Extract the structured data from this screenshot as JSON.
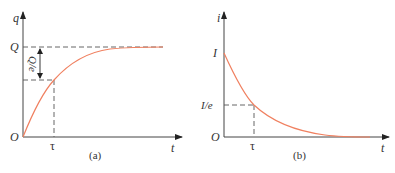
{
  "figure_a": {
    "caption": "(a)",
    "y_axis_label": "q",
    "x_axis_label": "t",
    "origin_label": "O",
    "level_label": "Q",
    "gap_label": "Q/e",
    "time_constant_label": "τ",
    "curve": "q = Q(1 - e^(-t/τ))",
    "curve_color": "#f08060"
  },
  "figure_b": {
    "caption": "(b)",
    "y_axis_label": "i",
    "x_axis_label": "t",
    "origin_label": "O",
    "level_label": "I",
    "decay_label": "I/e",
    "time_constant_label": "τ",
    "curve": "i = I e^(-t/τ)",
    "curve_color": "#f08060"
  }
}
